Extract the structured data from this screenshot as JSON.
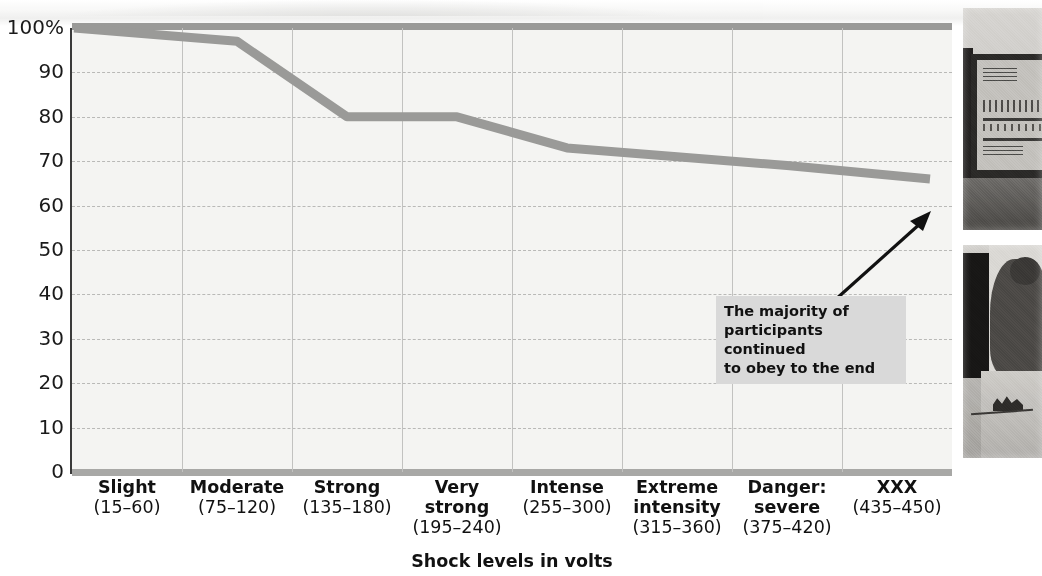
{
  "chart_data": {
    "type": "line",
    "title": "",
    "xlabel": "Shock levels in volts",
    "ylabel": "",
    "ylim": [
      0,
      100
    ],
    "xlim_categories": 8,
    "grid": true,
    "legend": "none",
    "categories": [
      "Slight",
      "Moderate",
      "Strong",
      "Very strong",
      "Intense",
      "Extreme intensity",
      "Danger: severe",
      "XXX"
    ],
    "category_ranges": [
      "(15–60)",
      "(75–120)",
      "(135–180)",
      "(195–240)",
      "(255–300)",
      "(315–360)",
      "(375–420)",
      "(435–450)"
    ],
    "values": [
      100,
      97,
      80,
      80,
      73,
      71,
      69,
      66
    ],
    "series": [
      {
        "name": "Percentage of participants still obeying",
        "values": [
          100,
          97,
          80,
          80,
          73,
          71,
          69,
          66
        ],
        "color": "#9a9a98"
      }
    ],
    "ytick_labels": [
      "100%",
      "90",
      "80",
      "70",
      "60",
      "50",
      "40",
      "30",
      "20",
      "10",
      "0"
    ],
    "ytick_values": [
      100,
      90,
      80,
      70,
      60,
      50,
      40,
      30,
      20,
      10,
      0
    ],
    "annotations": [
      {
        "text": "The majority of participants continued to obey to the end",
        "lines": [
          "The majority of",
          "participants continued",
          "to obey to the end"
        ],
        "points_to_category": "XXX",
        "points_to_value": 66
      }
    ]
  },
  "axis": {
    "x_caption": "Shock levels in volts",
    "y_ticks": [
      "100%",
      "90",
      "80",
      "70",
      "60",
      "50",
      "40",
      "30",
      "20",
      "10",
      "0"
    ]
  },
  "categories": [
    {
      "name": "Slight",
      "range": "(15–60)"
    },
    {
      "name": "Moderate",
      "range": "(75–120)"
    },
    {
      "name": "Strong",
      "range": "(135–180)"
    },
    {
      "name": "Very strong",
      "range": "(195–240)"
    },
    {
      "name": "Intense",
      "range": "(255–300)"
    },
    {
      "name": "Extreme intensity",
      "range": "(315–360)"
    },
    {
      "name": "Danger: severe",
      "range": "(375–420)"
    },
    {
      "name": "XXX",
      "range": "(435–450)"
    }
  ],
  "annotation": {
    "line1": "The majority of",
    "line2": "participants continued",
    "line3": "to obey to the end"
  },
  "photos": [
    {
      "id": "shock-generator-photo",
      "alt": "Shock generator apparatus"
    },
    {
      "id": "learner-photo",
      "alt": "Learner being strapped in"
    }
  ],
  "colors": {
    "line": "#9a9a98",
    "plot_background": "#f4f4f2",
    "grid": "#b9b9b7",
    "axis": "#3a3a3a",
    "callout_background": "#d9d9d9",
    "text": "#111111"
  }
}
